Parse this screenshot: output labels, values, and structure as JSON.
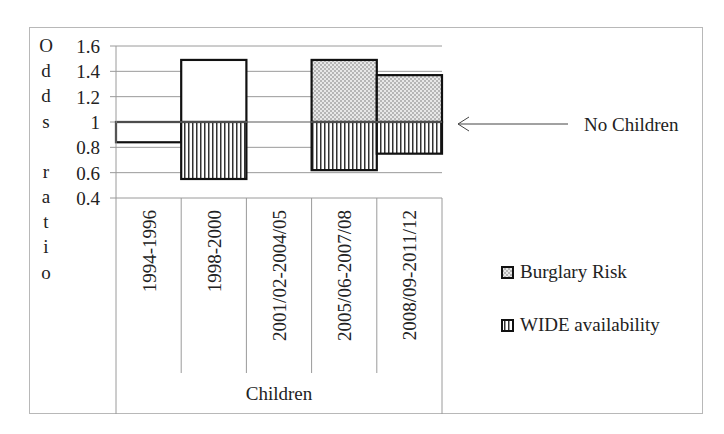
{
  "chart_data": {
    "type": "bar",
    "subtype": "floating bars relative to baseline 1.0 (odds ratio)",
    "title": "",
    "ylabel": "Odds ratio",
    "xlabel": "Children",
    "ylim": [
      0.4,
      1.6
    ],
    "yticks": [
      "1.6",
      "1.4",
      "1.2",
      "1",
      "0.8",
      "0.6",
      "0.4"
    ],
    "categories": [
      "1994-1996",
      "1998-2000",
      "2001/02-2004/05",
      "2005/06-2007/08",
      "2008/09-2011/12"
    ],
    "baseline": 1.0,
    "series": [
      {
        "name": "Burglary Risk",
        "pattern": "dots",
        "values": [
          0.84,
          1.49,
          null,
          1.49,
          1.37
        ]
      },
      {
        "name": "WIDE availability",
        "pattern": "vertical-lines",
        "values": [
          null,
          0.55,
          null,
          0.62,
          0.75
        ]
      }
    ],
    "annotation": "No Children",
    "legend_position": "right",
    "grid": true
  },
  "labels": {
    "y_axis_letters": [
      "O",
      "d",
      "d",
      "s",
      "",
      "r",
      "a",
      "t",
      "i",
      "o"
    ],
    "x_group": "Children",
    "annotation": "No Children",
    "legend": [
      "Burglary Risk",
      "WIDE availability"
    ]
  }
}
